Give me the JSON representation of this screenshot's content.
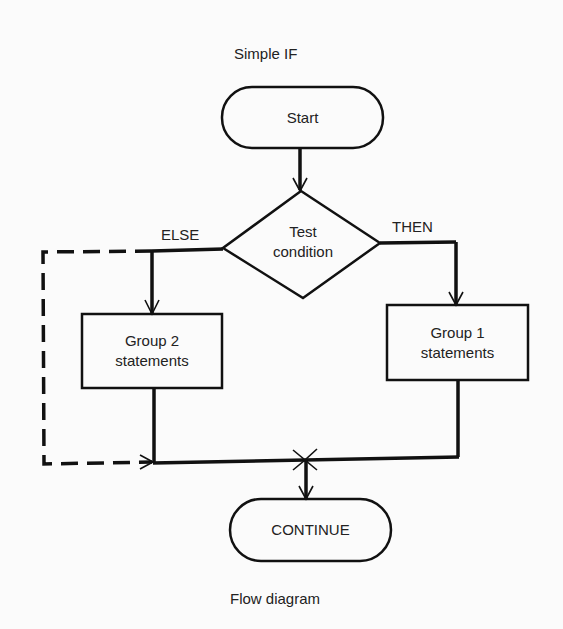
{
  "diagram": {
    "title": "Simple IF",
    "caption": "Flow diagram",
    "nodes": {
      "start": {
        "type": "terminal",
        "label": "Start"
      },
      "test": {
        "type": "decision",
        "line1": "Test",
        "line2": "condition"
      },
      "group2": {
        "type": "process",
        "line1": "Group 2",
        "line2": "statements"
      },
      "group1": {
        "type": "process",
        "line1": "Group 1",
        "line2": "statements"
      },
      "continue": {
        "type": "terminal",
        "label": "CONTINUE"
      }
    },
    "branches": {
      "else_label": "ELSE",
      "then_label": "THEN"
    },
    "edges": [
      {
        "from": "start",
        "to": "test",
        "style": "solid"
      },
      {
        "from": "test",
        "to": "group2",
        "label": "ELSE",
        "style": "solid"
      },
      {
        "from": "test",
        "to": "group1",
        "label": "THEN",
        "style": "solid"
      },
      {
        "from": "test",
        "to": "merge",
        "label": "ELSE (bypass)",
        "style": "dashed"
      },
      {
        "from": "group2",
        "to": "merge",
        "style": "solid"
      },
      {
        "from": "group1",
        "to": "merge",
        "style": "solid"
      },
      {
        "from": "merge",
        "to": "continue",
        "style": "solid"
      }
    ],
    "colors": {
      "stroke": "#111111",
      "background": "#fbfbfb",
      "text": "#222222"
    }
  }
}
